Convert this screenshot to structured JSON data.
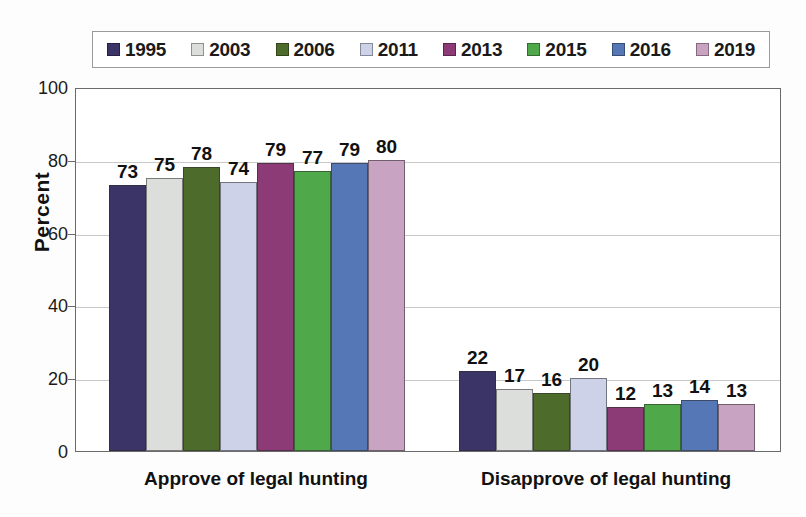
{
  "chart_data": {
    "type": "bar",
    "title": "",
    "subtitle": "",
    "xlabel": "",
    "ylabel": "Percent",
    "ylim": [
      0,
      100
    ],
    "yticks": [
      0,
      20,
      40,
      60,
      80,
      100
    ],
    "grid": true,
    "legend_position": "top",
    "categories": [
      "Approve of legal hunting",
      "Disapprove of legal hunting"
    ],
    "series": [
      {
        "name": "1995",
        "color": "#3b3466",
        "values": [
          73,
          22
        ]
      },
      {
        "name": "2003",
        "color": "#dcdedc",
        "values": [
          75,
          17
        ]
      },
      {
        "name": "2006",
        "color": "#4d6b2a",
        "values": [
          78,
          16
        ]
      },
      {
        "name": "2011",
        "color": "#cdd2e8",
        "values": [
          74,
          20
        ]
      },
      {
        "name": "2013",
        "color": "#8d3b77",
        "values": [
          79,
          12
        ]
      },
      {
        "name": "2015",
        "color": "#4fa84a",
        "values": [
          77,
          13
        ]
      },
      {
        "name": "2016",
        "color": "#5577b5",
        "values": [
          79,
          14
        ]
      },
      {
        "name": "2019",
        "color": "#c9a3c2",
        "values": [
          80,
          13
        ]
      }
    ]
  },
  "legend": {
    "items": [
      {
        "label": "1995",
        "color": "#3b3466"
      },
      {
        "label": "2003",
        "color": "#dcdedc"
      },
      {
        "label": "2006",
        "color": "#4d6b2a"
      },
      {
        "label": "2011",
        "color": "#cdd2e8"
      },
      {
        "label": "2013",
        "color": "#8d3b77"
      },
      {
        "label": "2015",
        "color": "#4fa84a"
      },
      {
        "label": "2016",
        "color": "#5577b5"
      },
      {
        "label": "2019",
        "color": "#c9a3c2"
      }
    ]
  },
  "axes": {
    "y_title": "Percent",
    "y_tick_labels": [
      "100",
      "80",
      "60",
      "40",
      "20",
      "0"
    ],
    "x_category_labels": [
      "Approve of legal hunting",
      "Disapprove of legal hunting"
    ]
  }
}
